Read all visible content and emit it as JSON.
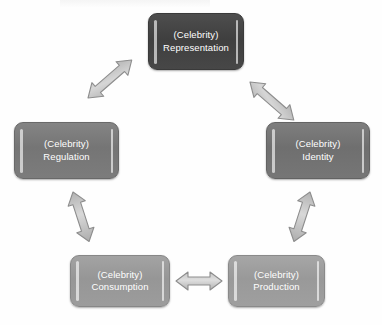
{
  "diagram": {
    "type": "cycle",
    "background_color": "#ffffff",
    "node_text_color": "#ffffff",
    "arrow_fill_color": "#c9c9c9",
    "arrow_stroke_color": "#8d8d8d",
    "nodes": [
      {
        "id": "representation",
        "prefix": "(Celebrity)",
        "label": "Representation",
        "color": "#454545",
        "position": "top"
      },
      {
        "id": "identity",
        "prefix": "(Celebrity)",
        "label": "Identity",
        "color": "#757575",
        "position": "right"
      },
      {
        "id": "production",
        "prefix": "(Celebrity)",
        "label": "Production",
        "color": "#9d9d9d",
        "position": "bottom-right"
      },
      {
        "id": "consumption",
        "prefix": "(Celebrity)",
        "label": "Consumption",
        "color": "#9a9a9a",
        "position": "bottom-left"
      },
      {
        "id": "regulation",
        "prefix": "(Celebrity)",
        "label": "Regulation",
        "color": "#7b7b7b",
        "position": "left"
      }
    ],
    "connectors": [
      {
        "id": "representation-identity",
        "from": "representation",
        "to": "identity",
        "style": "double-headed"
      },
      {
        "id": "identity-production",
        "from": "identity",
        "to": "production",
        "style": "double-headed"
      },
      {
        "id": "production-consumption",
        "from": "production",
        "to": "consumption",
        "style": "double-headed"
      },
      {
        "id": "consumption-regulation",
        "from": "consumption",
        "to": "regulation",
        "style": "double-headed"
      },
      {
        "id": "regulation-representation",
        "from": "regulation",
        "to": "representation",
        "style": "double-headed"
      }
    ]
  }
}
